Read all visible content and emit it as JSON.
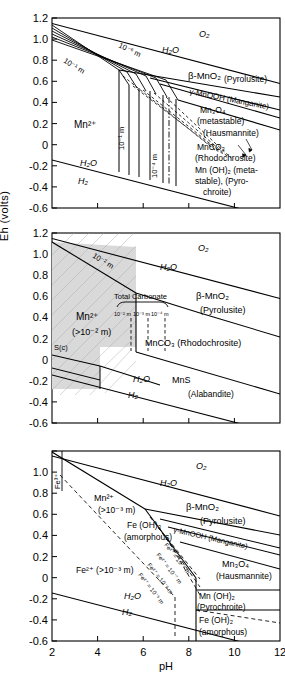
{
  "figure": {
    "type": "eh-ph-pourbaix-diagram",
    "axis": {
      "ylabel": "Eh (volts)",
      "xlabel": "pH",
      "yticks": [
        "1.2",
        "1.0",
        "0.8",
        "0.6",
        "0.4",
        "0.2",
        "0",
        "-0.2",
        "-0.4",
        "-0.6"
      ],
      "ytick_values": [
        1.2,
        1.0,
        0.8,
        0.6,
        0.4,
        0.2,
        0.0,
        -0.2,
        -0.4,
        -0.6
      ],
      "xticks": [
        "2",
        "4",
        "6",
        "8",
        "10",
        "12"
      ],
      "xtick_values": [
        2,
        4,
        6,
        8,
        10,
        12
      ],
      "ylim": [
        -0.6,
        1.2
      ],
      "xlim": [
        2,
        12
      ],
      "grid": false
    },
    "colors": {
      "line": "#000000",
      "background": "#ffffff",
      "shaded_field": "#d9d9d9"
    }
  },
  "panels": [
    {
      "id": "panel-a",
      "name": "mn-oxide-system",
      "labels": [
        {
          "key": "o2",
          "text": "O₂"
        },
        {
          "key": "h2o_upper",
          "text": "H₂O"
        },
        {
          "key": "h2o_lower",
          "text": "H₂O"
        },
        {
          "key": "h2",
          "text": "H₂"
        },
        {
          "key": "mn2plus",
          "text": "Mn²⁺"
        },
        {
          "key": "conc_1e1",
          "text": "10⁻¹ m"
        },
        {
          "key": "conc_1e6",
          "text": "10⁻⁶ m"
        },
        {
          "key": "beta_mno2",
          "text": "β-MnO₂"
        },
        {
          "key": "pyrolusite",
          "text": "(Pyrolusite)"
        },
        {
          "key": "gamma_mnooh",
          "text": "γ-MnOOH (Manganite)"
        },
        {
          "key": "mn3o4",
          "text": "Mn₃O₄"
        },
        {
          "key": "metastable1",
          "text": "(metastable)"
        },
        {
          "key": "hausmannite",
          "text": "(Hausmannite)"
        },
        {
          "key": "mnco3",
          "text": "MnCO₃"
        },
        {
          "key": "rhodochrosite",
          "text": "(Rhodochrosite)"
        },
        {
          "key": "mnoh2",
          "text": "Mn (OH)₂ (meta-"
        },
        {
          "key": "mnoh2b",
          "text": "stable), (Pyro-"
        },
        {
          "key": "mnoh2c",
          "text": "chroite)"
        },
        {
          "key": "vline_1e1",
          "text": "10⁻¹ m"
        },
        {
          "key": "vline_1e4",
          "text": "10⁻⁴ m"
        }
      ]
    },
    {
      "id": "panel-b",
      "name": "mn-carbonate-sulfide-system",
      "labels": [
        {
          "key": "o2",
          "text": "O₂"
        },
        {
          "key": "h2o_upper",
          "text": "H₂O"
        },
        {
          "key": "h2o_lower",
          "text": "H₂O"
        },
        {
          "key": "h2",
          "text": "H₂"
        },
        {
          "key": "conc_1e2",
          "text": "10⁻² m"
        },
        {
          "key": "mn2plus",
          "text": "Mn²⁺"
        },
        {
          "key": "mn2plus_conc",
          "text": "(>10⁻² m)"
        },
        {
          "key": "sc",
          "text": "S(c)"
        },
        {
          "key": "total_carb",
          "text": "Total Carbonate"
        },
        {
          "key": "carb_1e2",
          "text": "10⁻² m"
        },
        {
          "key": "carb_1e3",
          "text": "10⁻³ m"
        },
        {
          "key": "carb_1e4",
          "text": "10⁻⁴ m"
        },
        {
          "key": "beta_mno2",
          "text": "β-MnO₂"
        },
        {
          "key": "pyrolusite",
          "text": "(Pyrolusite)"
        },
        {
          "key": "mnco3",
          "text": "MnCO₃ (Rhodochrosite)"
        },
        {
          "key": "mns",
          "text": "MnS"
        },
        {
          "key": "alabandite",
          "text": "(Alabandite)"
        }
      ]
    },
    {
      "id": "panel-c",
      "name": "fe-mn-system",
      "labels": [
        {
          "key": "o2",
          "text": "O₂"
        },
        {
          "key": "h2o_upper",
          "text": "H₂O"
        },
        {
          "key": "h2o_lower",
          "text": "H₂O"
        },
        {
          "key": "h2",
          "text": "H₂"
        },
        {
          "key": "fe3plus",
          "text": "Fe³⁺"
        },
        {
          "key": "mn2plus",
          "text": "Mn²⁺"
        },
        {
          "key": "mn2plus_conc",
          "text": "(>10⁻³ m)"
        },
        {
          "key": "feoh3",
          "text": "Fe (OH)₃"
        },
        {
          "key": "amorphous1",
          "text": "(amorphous)"
        },
        {
          "key": "fe2plus",
          "text": "Fe²⁺ (>10⁻³ m)"
        },
        {
          "key": "fe2_1e8",
          "text": "Fe²⁺ = 10⁻⁸ m"
        },
        {
          "key": "fe2_1e7",
          "text": "Fe²⁺ = 10⁻⁷ m"
        },
        {
          "key": "fe2_1e6",
          "text": "Fe²⁺ = 10⁻⁶ m"
        },
        {
          "key": "fe2_1e5",
          "text": "Fe²⁺ = 10⁻⁵ m"
        },
        {
          "key": "beta_mno2",
          "text": "β-MnO₂"
        },
        {
          "key": "pyrolusite",
          "text": "(Pyrolusite)"
        },
        {
          "key": "gamma_mnooh",
          "text": "γ-MnOOH (Manganite)"
        },
        {
          "key": "mn3o4",
          "text": "Mn₃O₄"
        },
        {
          "key": "hausmannite",
          "text": "(Hausmannite)"
        },
        {
          "key": "mnoh2",
          "text": "Mn (OH)₂"
        },
        {
          "key": "pyrochroite",
          "text": "(Pyrochroite)"
        },
        {
          "key": "feoh2",
          "text": "Fe (OH)₂"
        },
        {
          "key": "amorphous2",
          "text": "(amorphous)"
        }
      ]
    }
  ]
}
